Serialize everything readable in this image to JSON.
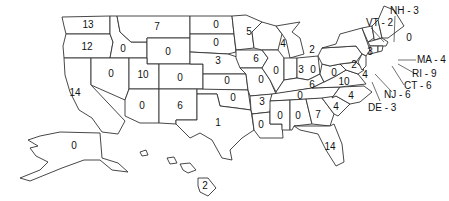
{
  "map": {
    "type": "choropleth-count-map",
    "region": "United States",
    "states": {
      "WA": {
        "name": "Washington",
        "value": "13"
      },
      "OR": {
        "name": "Oregon",
        "value": "12"
      },
      "CA": {
        "name": "California",
        "value": "14"
      },
      "ID": {
        "name": "Idaho",
        "value": "0"
      },
      "NV": {
        "name": "Nevada",
        "value": "0"
      },
      "MT": {
        "name": "Montana",
        "value": "7"
      },
      "WY": {
        "name": "Wyoming",
        "value": "0"
      },
      "UT": {
        "name": "Utah",
        "value": "10"
      },
      "AZ": {
        "name": "Arizona",
        "value": "0"
      },
      "CO": {
        "name": "Colorado",
        "value": "0"
      },
      "NM": {
        "name": "New Mexico",
        "value": "6"
      },
      "ND": {
        "name": "North Dakota",
        "value": "0"
      },
      "SD": {
        "name": "South Dakota",
        "value": "0"
      },
      "NE": {
        "name": "Nebraska",
        "value": "3"
      },
      "KS": {
        "name": "Kansas",
        "value": "0"
      },
      "OK": {
        "name": "Oklahoma",
        "value": "0"
      },
      "TX": {
        "name": "Texas",
        "value": "1"
      },
      "MN": {
        "name": "Minnesota",
        "value": "5"
      },
      "IA": {
        "name": "Iowa",
        "value": "6"
      },
      "MO": {
        "name": "Missouri",
        "value": "0"
      },
      "AR": {
        "name": "Arkansas",
        "value": "3"
      },
      "LA": {
        "name": "Louisiana",
        "value": "0"
      },
      "WI": {
        "name": "Wisconsin",
        "value": "4"
      },
      "IL": {
        "name": "Illinois",
        "value": "0"
      },
      "MI": {
        "name": "Michigan",
        "value": "2"
      },
      "IN": {
        "name": "Indiana",
        "value": "3"
      },
      "OH": {
        "name": "Ohio",
        "value": "0"
      },
      "KY": {
        "name": "Kentucky",
        "value": "6"
      },
      "TN": {
        "name": "Tennessee",
        "value": "0"
      },
      "MS": {
        "name": "Mississippi",
        "value": "0"
      },
      "AL": {
        "name": "Alabama",
        "value": "0"
      },
      "GA": {
        "name": "Georgia",
        "value": "7"
      },
      "FL": {
        "name": "Florida",
        "value": "14"
      },
      "SC": {
        "name": "South Carolina",
        "value": "4"
      },
      "NC": {
        "name": "North Carolina",
        "value": "4"
      },
      "VA": {
        "name": "Virginia",
        "value": "10"
      },
      "WV": {
        "name": "West Virginia",
        "value": "0"
      },
      "MD": {
        "name": "Maryland",
        "value": "4"
      },
      "PA": {
        "name": "Pennsylvania",
        "value": "2"
      },
      "NY": {
        "name": "New York",
        "value": "3"
      },
      "ME": {
        "name": "Maine",
        "value": "0"
      },
      "AK": {
        "name": "Alaska",
        "value": "0"
      },
      "HI": {
        "name": "Hawaii",
        "value": "2"
      }
    },
    "callouts": {
      "NH": "NH - 3",
      "VT": "VT - 2",
      "MA": "MA - 4",
      "RI": "RI - 9",
      "CT": "CT - 6",
      "NJ": "NJ - 6",
      "DE": "DE - 3"
    }
  }
}
